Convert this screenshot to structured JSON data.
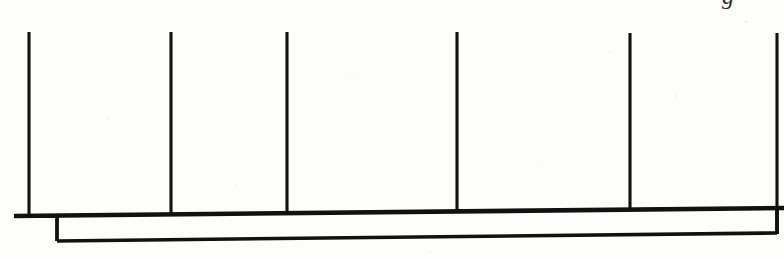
{
  "figure": {
    "name": "elevation-line-drawing",
    "width": 784,
    "height": 258,
    "background_color": "#fdfdfc",
    "ink_color": "#111111"
  },
  "posts": [
    {
      "id": "post-1",
      "x": 29,
      "y_top": 32,
      "y_bottom": 215
    },
    {
      "id": "post-2",
      "x": 171,
      "y_top": 32,
      "y_bottom": 214
    },
    {
      "id": "post-3",
      "x": 287,
      "y_top": 32,
      "y_bottom": 213
    },
    {
      "id": "post-4",
      "x": 457,
      "y_top": 32,
      "y_bottom": 212
    },
    {
      "id": "post-5",
      "x": 630,
      "y_top": 33,
      "y_bottom": 210
    },
    {
      "id": "post-6",
      "x": 777,
      "y_top": 33,
      "y_bottom": 234
    }
  ],
  "rail": {
    "id": "upper-rail",
    "x_start": 14,
    "y_start": 216,
    "x_end": 784,
    "y_end": 208
  },
  "lower_edge": {
    "id": "lower-edge",
    "x_start": 57,
    "y_start": 241,
    "x_end": 777,
    "y_end": 233
  },
  "left_stub": {
    "id": "left-stub",
    "x_start": 14,
    "y": 216,
    "x_end": 57
  },
  "left_riser": {
    "id": "left-riser",
    "x": 57,
    "y_top": 216,
    "y_bottom": 241
  },
  "right_riser": {
    "id": "right-riser",
    "x": 777,
    "y_top": 208,
    "y_bottom": 234
  },
  "cropped_glyph": {
    "id": "cropped-descender",
    "text": "g",
    "x": 722,
    "y": 4,
    "font_size": 24,
    "note": "descender of a letter cut off by the top crop edge"
  },
  "speckles": [
    {
      "x": 108,
      "y": 118,
      "r": 0.7
    },
    {
      "x": 352,
      "y": 74,
      "r": 0.6
    },
    {
      "x": 540,
      "y": 160,
      "r": 0.6
    },
    {
      "x": 676,
      "y": 96,
      "r": 0.7
    },
    {
      "x": 236,
      "y": 186,
      "r": 0.6
    },
    {
      "x": 610,
      "y": 52,
      "r": 0.6
    },
    {
      "x": 746,
      "y": 22,
      "r": 0.8
    },
    {
      "x": 96,
      "y": 248,
      "r": 0.6
    },
    {
      "x": 430,
      "y": 252,
      "r": 0.6
    }
  ]
}
